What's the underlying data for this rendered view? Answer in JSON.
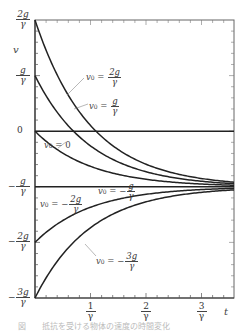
{
  "chart_data": {
    "type": "line",
    "title": "",
    "xlabel": "t",
    "ylabel": "v",
    "x_unit": "1/γ",
    "y_unit": "g/γ",
    "xlim": [
      0,
      3.5
    ],
    "ylim": [
      -3,
      2
    ],
    "grid": false,
    "formula": "v(t) = -g/γ + (v0 + g/γ) e^(-γt)",
    "x_ticks": [
      {
        "value": 1,
        "num": "1",
        "den": "γ"
      },
      {
        "value": 2,
        "num": "2",
        "den": "γ"
      },
      {
        "value": 3,
        "num": "3",
        "den": "γ"
      }
    ],
    "y_ticks": [
      {
        "value": 2,
        "sign": "",
        "num": "2g",
        "den": "γ"
      },
      {
        "value": 1,
        "sign": "",
        "num": "g",
        "den": "γ"
      },
      {
        "value": 0,
        "sign": "",
        "num": "0",
        "den": ""
      },
      {
        "value": -1,
        "sign": "−",
        "num": "g",
        "den": "γ"
      },
      {
        "value": -2,
        "sign": "−",
        "num": "2g",
        "den": "γ"
      },
      {
        "value": -3,
        "sign": "−",
        "num": "3g",
        "den": "γ"
      }
    ],
    "series": [
      {
        "name": "v0 = 2g/γ",
        "v0": 2,
        "label_sign": "",
        "label_num": "2g",
        "label_den": "γ"
      },
      {
        "name": "v0 = g/γ",
        "v0": 1,
        "label_sign": "",
        "label_num": "g",
        "label_den": "γ"
      },
      {
        "name": "v0 = 0",
        "v0": 0,
        "label_sign": "",
        "label_num": "0",
        "label_den": ""
      },
      {
        "name": "v0 = -g/γ",
        "v0": -1,
        "label_sign": "−",
        "label_num": "g",
        "label_den": "γ"
      },
      {
        "name": "v0 = -2g/γ",
        "v0": -2,
        "label_sign": "−",
        "label_num": "2g",
        "label_den": "γ"
      },
      {
        "name": "v0 = -3g/γ",
        "v0": -3,
        "label_sign": "−",
        "label_num": "3g",
        "label_den": "γ"
      }
    ],
    "reference_lines": [
      {
        "y": 0,
        "name": "zero-line"
      }
    ],
    "asymptote": -1
  },
  "labels": {
    "v_axis": "v",
    "t_axis": "t",
    "v0_prefix": "v",
    "v0_sub": "0",
    "eq": " = ",
    "caption": "図　　抵抗を受ける物体の速度の時間変化"
  },
  "colors": {
    "curve": "#222222",
    "frame": "#666666",
    "leader": "#888888"
  }
}
